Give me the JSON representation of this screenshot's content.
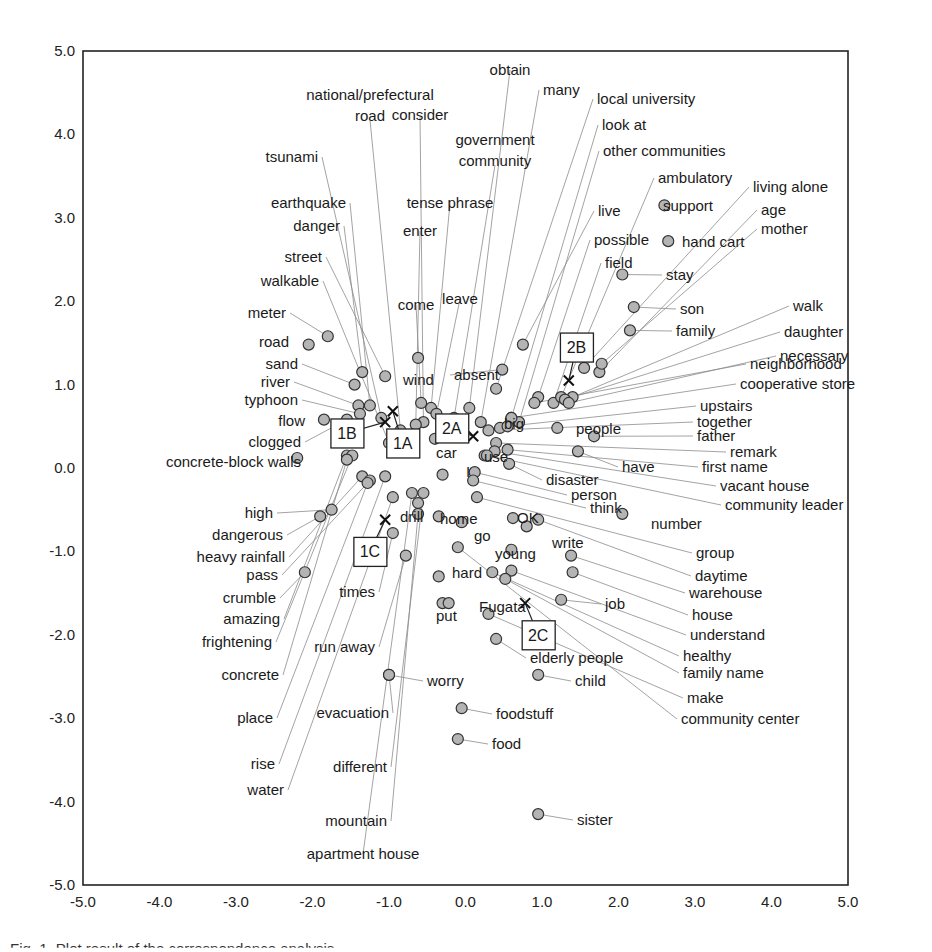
{
  "chart_data": {
    "type": "scatter",
    "title": "",
    "xlabel": "",
    "ylabel": "",
    "xlim": [
      -5.0,
      5.0
    ],
    "ylim": [
      -5.0,
      5.0
    ],
    "grid": false,
    "legend": "none",
    "x_ticks": [
      "-5.0",
      "-4.0",
      "-3.0",
      "-2.0",
      "-1.0",
      "0.0",
      "1.0",
      "2.0",
      "3.0",
      "4.0",
      "5.0"
    ],
    "y_ticks": [
      "5.0",
      "4.0",
      "3.0",
      "2.0",
      "1.0",
      "0.0",
      "-1.0",
      "-2.0",
      "-3.0",
      "-4.0",
      "-5.0"
    ],
    "marker_color": "#b4b4b4",
    "groups": [
      {
        "label": "1A",
        "x": -0.95,
        "y": 0.68,
        "box_x": -0.82,
        "box_y": 0.3
      },
      {
        "label": "1B",
        "x": -1.05,
        "y": 0.55,
        "box_x": -1.55,
        "box_y": 0.42
      },
      {
        "label": "1C",
        "x": -1.05,
        "y": -0.62,
        "box_x": -1.25,
        "box_y": -1.0
      },
      {
        "label": "2A",
        "x": 0.1,
        "y": 0.38,
        "box_x": -0.18,
        "box_y": 0.48
      },
      {
        "label": "2B",
        "x": 1.35,
        "y": 1.05,
        "box_x": 1.45,
        "box_y": 1.45
      },
      {
        "label": "2C",
        "x": 0.78,
        "y": -1.62,
        "box_x": 0.95,
        "box_y": -2.0
      }
    ],
    "points": [
      {
        "label": "national/prefectural road",
        "x": -0.85,
        "y": 0.45
      },
      {
        "label": "consider",
        "x": -0.55,
        "y": 0.55
      },
      {
        "label": "government community",
        "x": -0.15,
        "y": 0.6
      },
      {
        "label": "obtain",
        "x": 0.05,
        "y": 0.72
      },
      {
        "label": "many",
        "x": 0.2,
        "y": 0.55
      },
      {
        "label": "local university",
        "x": 0.4,
        "y": 0.95
      },
      {
        "label": "look at",
        "x": 0.6,
        "y": 0.6
      },
      {
        "label": "other communities",
        "x": 0.7,
        "y": 0.55
      },
      {
        "label": "tsunami",
        "x": -1.1,
        "y": 0.6
      },
      {
        "label": "earthquake",
        "x": -1.25,
        "y": 0.75
      },
      {
        "label": "danger",
        "x": -1.35,
        "y": 1.15
      },
      {
        "label": "tense phrase",
        "x": -0.45,
        "y": 0.72
      },
      {
        "label": "enter",
        "x": -0.65,
        "y": 0.52
      },
      {
        "label": "street",
        "x": -1.05,
        "y": 1.1
      },
      {
        "label": "walkable",
        "x": -1.0,
        "y": 0.3
      },
      {
        "label": "come",
        "x": -0.58,
        "y": 0.78
      },
      {
        "label": "leave",
        "x": -0.38,
        "y": 0.65
      },
      {
        "label": "meter",
        "x": -1.8,
        "y": 1.58
      },
      {
        "label": "road",
        "x": -2.05,
        "y": 1.48
      },
      {
        "label": "sand",
        "x": -1.45,
        "y": 1.0
      },
      {
        "label": "river",
        "x": -1.4,
        "y": 0.75
      },
      {
        "label": "typhoon",
        "x": -1.38,
        "y": 0.65
      },
      {
        "label": "flow",
        "x": -1.85,
        "y": 0.58
      },
      {
        "label": "clogged",
        "x": -1.55,
        "y": 0.58
      },
      {
        "label": "concrete-block walls",
        "x": -2.2,
        "y": 0.12
      },
      {
        "label": "wind",
        "x": -0.62,
        "y": 1.32
      },
      {
        "label": "absent",
        "x": 0.48,
        "y": 1.18
      },
      {
        "label": "big",
        "x": 0.45,
        "y": 0.48
      },
      {
        "label": "car",
        "x": -0.4,
        "y": 0.35
      },
      {
        "label": "use",
        "x": 0.25,
        "y": 0.15
      },
      {
        "label": "I",
        "x": -0.3,
        "y": -0.08
      },
      {
        "label": "live",
        "x": 0.75,
        "y": 1.48
      },
      {
        "label": "possible",
        "x": 0.95,
        "y": 0.85
      },
      {
        "label": "field",
        "x": 1.15,
        "y": 0.78
      },
      {
        "label": "ambulatory",
        "x": 1.25,
        "y": 0.85
      },
      {
        "label": "support",
        "x": 2.6,
        "y": 3.15
      },
      {
        "label": "living alone",
        "x": 1.55,
        "y": 1.2
      },
      {
        "label": "age",
        "x": 1.75,
        "y": 1.15
      },
      {
        "label": "mother",
        "x": 1.78,
        "y": 1.25
      },
      {
        "label": "hand cart",
        "x": 2.65,
        "y": 2.72
      },
      {
        "label": "stay",
        "x": 2.05,
        "y": 2.32
      },
      {
        "label": "son",
        "x": 2.2,
        "y": 1.93
      },
      {
        "label": "family",
        "x": 2.15,
        "y": 1.65
      },
      {
        "label": "walk",
        "x": 1.4,
        "y": 0.85
      },
      {
        "label": "daughter",
        "x": 1.3,
        "y": 0.82
      },
      {
        "label": "necessary",
        "x": 1.35,
        "y": 0.78
      },
      {
        "label": "neighborhood",
        "x": 0.9,
        "y": 0.78
      },
      {
        "label": "cooperative store",
        "x": 0.6,
        "y": 0.6
      },
      {
        "label": "upstairs",
        "x": 0.55,
        "y": 0.5
      },
      {
        "label": "together",
        "x": 0.3,
        "y": 0.45
      },
      {
        "label": "people",
        "x": 1.2,
        "y": 0.48
      },
      {
        "label": "father",
        "x": 1.68,
        "y": 0.38
      },
      {
        "label": "remark",
        "x": 0.4,
        "y": 0.3
      },
      {
        "label": "have",
        "x": 1.47,
        "y": 0.2
      },
      {
        "label": "first name",
        "x": 0.55,
        "y": 0.22
      },
      {
        "label": "vacant house",
        "x": 0.38,
        "y": 0.2
      },
      {
        "label": "community leader",
        "x": 0.28,
        "y": 0.15
      },
      {
        "label": "disaster",
        "x": 0.57,
        "y": 0.05
      },
      {
        "label": "person",
        "x": 0.12,
        "y": -0.05
      },
      {
        "label": "think",
        "x": 0.1,
        "y": -0.15
      },
      {
        "label": "number",
        "x": 2.05,
        "y": -0.55
      },
      {
        "label": "group",
        "x": 0.15,
        "y": -0.35
      },
      {
        "label": "OK",
        "x": 0.62,
        "y": -0.6
      },
      {
        "label": "drill",
        "x": -0.62,
        "y": -0.42
      },
      {
        "label": "home",
        "x": -0.35,
        "y": -0.58
      },
      {
        "label": "go",
        "x": -0.05,
        "y": -0.65
      },
      {
        "label": "write",
        "x": 0.8,
        "y": -0.7
      },
      {
        "label": "young",
        "x": 0.6,
        "y": -0.98
      },
      {
        "label": "daytime",
        "x": 0.95,
        "y": -0.62
      },
      {
        "label": "warehouse",
        "x": 1.38,
        "y": -1.05
      },
      {
        "label": "house",
        "x": 1.4,
        "y": -1.25
      },
      {
        "label": "understand",
        "x": 0.6,
        "y": -1.23
      },
      {
        "label": "healthy",
        "x": 0.35,
        "y": -1.25
      },
      {
        "label": "family name",
        "x": 0.52,
        "y": -1.33
      },
      {
        "label": "job",
        "x": 1.25,
        "y": -1.58
      },
      {
        "label": "hard",
        "x": -0.35,
        "y": -1.3
      },
      {
        "label": "put",
        "x": -0.3,
        "y": -1.62
      },
      {
        "label": "Fugata",
        "x": -0.22,
        "y": -1.62
      },
      {
        "label": "elderly people",
        "x": 0.4,
        "y": -2.05
      },
      {
        "label": "make",
        "x": 0.3,
        "y": -1.75
      },
      {
        "label": "community center",
        "x": -0.1,
        "y": -0.95
      },
      {
        "label": "child",
        "x": 0.95,
        "y": -2.48
      },
      {
        "label": "worry",
        "x": -1.0,
        "y": -2.48
      },
      {
        "label": "foodstuff",
        "x": -0.05,
        "y": -2.88
      },
      {
        "label": "food",
        "x": -0.1,
        "y": -3.25
      },
      {
        "label": "sister",
        "x": 0.95,
        "y": -4.15
      },
      {
        "label": "high",
        "x": -1.75,
        "y": -0.5
      },
      {
        "label": "dangerous",
        "x": -1.9,
        "y": -0.58
      },
      {
        "label": "heavy rainfall",
        "x": -1.35,
        "y": -0.1
      },
      {
        "label": "pass",
        "x": -1.25,
        "y": -0.15
      },
      {
        "label": "crumble",
        "x": -2.1,
        "y": -1.25
      },
      {
        "label": "amazing",
        "x": -1.55,
        "y": 0.15
      },
      {
        "label": "frightening",
        "x": -1.48,
        "y": 0.15
      },
      {
        "label": "times",
        "x": -0.95,
        "y": -0.78
      },
      {
        "label": "run away",
        "x": -0.78,
        "y": -1.05
      },
      {
        "label": "concrete",
        "x": -1.55,
        "y": 0.1
      },
      {
        "label": "place",
        "x": -1.28,
        "y": -0.18
      },
      {
        "label": "evacuation",
        "x": -1.0,
        "y": -2.48
      },
      {
        "label": "rise",
        "x": -1.05,
        "y": -0.1
      },
      {
        "label": "water",
        "x": -0.95,
        "y": -0.35
      },
      {
        "label": "different",
        "x": -0.55,
        "y": -0.3
      },
      {
        "label": "mountain",
        "x": -0.62,
        "y": -0.55
      },
      {
        "label": "apartment house",
        "x": -0.7,
        "y": -0.3
      }
    ]
  },
  "plot": {
    "x_ticks": [
      "-5.0",
      "-4.0",
      "-3.0",
      "-2.0",
      "-1.0",
      "0.0",
      "1.0",
      "2.0",
      "3.0",
      "4.0",
      "5.0"
    ],
    "y_ticks": [
      "5.0",
      "4.0",
      "3.0",
      "2.0",
      "1.0",
      "0.0",
      "-1.0",
      "-2.0",
      "-3.0",
      "-4.0",
      "-5.0"
    ],
    "group_labels": [
      "1A",
      "1B",
      "1C",
      "2A",
      "2B",
      "2C"
    ]
  },
  "caption": "Fig. 1. Plot result of the correspondence analysis"
}
